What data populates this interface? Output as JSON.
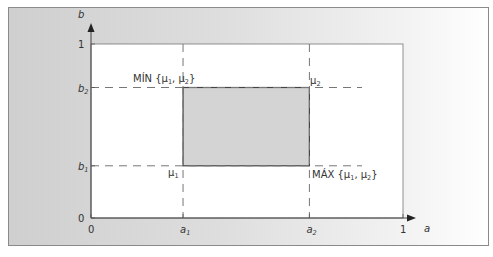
{
  "diagram": {
    "axes": {
      "x_label": "a",
      "y_label": "b",
      "x_ticks": [
        {
          "value": 0,
          "label": "0",
          "sub": ""
        },
        {
          "value": 0.295,
          "label": "a",
          "sub": "1"
        },
        {
          "value": 0.7,
          "label": "a",
          "sub": "2"
        },
        {
          "value": 1,
          "label": "1",
          "sub": ""
        }
      ],
      "y_ticks": [
        {
          "value": 0,
          "label": "0",
          "sub": ""
        },
        {
          "value": 0.3,
          "label": "b",
          "sub": "1"
        },
        {
          "value": 0.75,
          "label": "b",
          "sub": "2"
        },
        {
          "value": 1,
          "label": "1",
          "sub": ""
        }
      ]
    },
    "region": {
      "a1": 0.295,
      "a2": 0.7,
      "b1": 0.3,
      "b2": 0.75
    },
    "annotations": {
      "min_label": "MÍN {μ",
      "min_sub1": "1",
      "min_mid": ", μ",
      "min_sub2": "2",
      "min_end": "}",
      "max_label": "MÁX {μ",
      "max_sub1": "1",
      "max_mid": ", μ",
      "max_sub2": "2",
      "max_end": "}",
      "mu1": "μ",
      "mu1_sub": "1",
      "mu2": "μ",
      "mu2_sub": "2"
    },
    "colors": {
      "frame": "#8a8a8a",
      "band_dark": "#d2d2d2",
      "band_light": "#ffffff",
      "region_fill": "#d4d4d4",
      "line": "#444444",
      "dash": "#777777"
    }
  }
}
